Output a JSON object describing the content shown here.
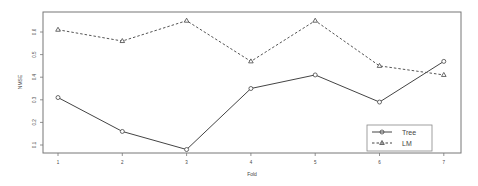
{
  "chart_data": {
    "type": "line",
    "title": "",
    "xlabel": "Fold",
    "ylabel": "NMSE",
    "x": [
      1,
      2,
      3,
      4,
      5,
      6,
      7
    ],
    "xticks": [
      "1",
      "2",
      "3",
      "4",
      "5",
      "6",
      "7"
    ],
    "yticks": [
      "0.1",
      "0.2",
      "0.3",
      "0.4",
      "0.5",
      "0.6"
    ],
    "ylim": [
      0.07,
      0.69
    ],
    "grid": false,
    "legend_position": "bottom-right",
    "series": [
      {
        "name": "Tree",
        "style": "solid",
        "marker": "circle",
        "values": [
          0.31,
          0.16,
          0.08,
          0.35,
          0.41,
          0.29,
          0.47
        ]
      },
      {
        "name": "LM",
        "style": "dashed",
        "marker": "triangle",
        "values": [
          0.61,
          0.56,
          0.65,
          0.47,
          0.65,
          0.45,
          0.41
        ]
      }
    ]
  },
  "colors": {
    "line": "#444444",
    "axis": "#666666"
  }
}
